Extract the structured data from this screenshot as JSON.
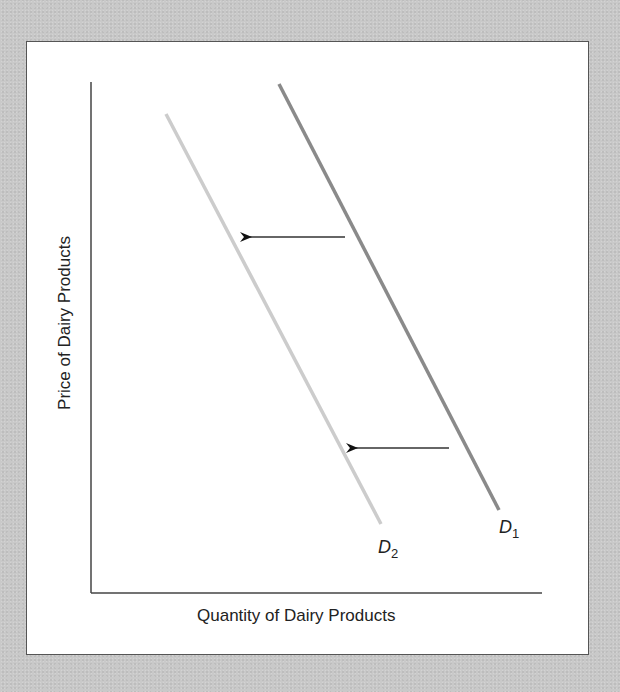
{
  "diagram": {
    "type": "supply-demand",
    "x_axis_label": "Quantity of Dairy Products",
    "y_axis_label": "Price of Dairy Products",
    "curves": [
      {
        "name": "D1",
        "letter": "D",
        "subscript": "1",
        "color": "#8a8a8a",
        "from": [
          279,
          84
        ],
        "to": [
          499,
          510
        ]
      },
      {
        "name": "D2",
        "letter": "D",
        "subscript": "2",
        "color": "#cccccc",
        "from": [
          166,
          114
        ],
        "to": [
          381,
          524
        ]
      }
    ],
    "arrows": [
      {
        "from": [
          345,
          237
        ],
        "to": [
          244,
          237
        ],
        "direction": "left"
      },
      {
        "from": [
          449,
          448
        ],
        "to": [
          350,
          448
        ],
        "direction": "left"
      }
    ],
    "shift": "demand decreases (D1 to D2)"
  }
}
